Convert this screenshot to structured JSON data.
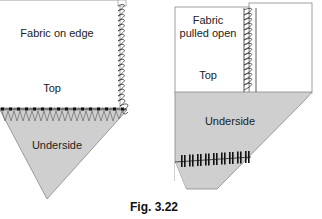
{
  "figure": {
    "caption": "Fig. 3.22",
    "colors": {
      "fabric_top": "#ffffff",
      "fabric_underside": "#cfcfcf",
      "outline": "#888888",
      "stitch": "#222222"
    },
    "left_panel": {
      "title": "Fabric on edge",
      "top_label": "Top",
      "underside_label": "Underside"
    },
    "right_panel": {
      "title_line1": "Fabric",
      "title_line2": "pulled open",
      "top_label": "Top",
      "underside_label": "Underside"
    }
  }
}
